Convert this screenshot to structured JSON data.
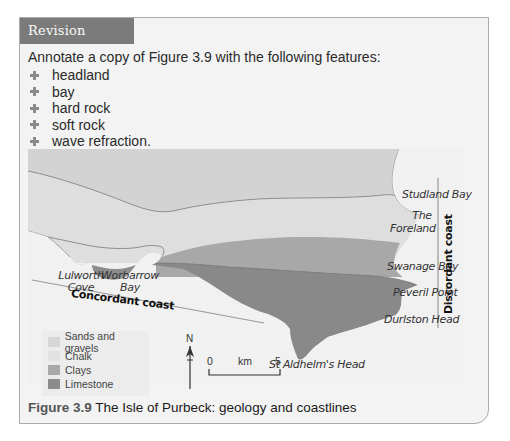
{
  "activity": {
    "header": "Revision activity",
    "intro": "Annotate a copy of Figure 3.9 with the following features:",
    "items": [
      "headland",
      "bay",
      "hard rock",
      "soft rock",
      "wave refraction."
    ]
  },
  "map": {
    "labels": {
      "studland_bay": "Studland Bay",
      "the_foreland_1": "The",
      "the_foreland_2": "Foreland",
      "swanage_bay": "Swanage Bay",
      "peveril_point": "Peveril Point",
      "durlston_head": "Durlston Head",
      "st_aldhelms_head": "St Aldhelm's Head",
      "lulworth_1": "Lulworth",
      "lulworth_2": "Cove",
      "worbarrow_1": "Worbarrow",
      "worbarrow_2": "Bay",
      "concordant_coast": "Concordant coast",
      "discordant_coast": "Discordant coast"
    },
    "legend": [
      {
        "label": "Sands and gravels",
        "color": "#d6d6d6"
      },
      {
        "label": "Chalk",
        "color": "#e0e0e0"
      },
      {
        "label": "Clays",
        "color": "#a9a9a9"
      },
      {
        "label": "Limestone",
        "color": "#8c8c8c"
      }
    ],
    "north_label": "N",
    "scale": {
      "start": "0",
      "unit": "km",
      "end": "5"
    },
    "colors": {
      "sea": "#f3f3f3",
      "sands": "#d2d2d2",
      "chalk": "#dedede",
      "clays": "#a8a8a8",
      "limestone": "#8a8a8a",
      "boundary": "#8e8e8e"
    }
  },
  "caption": {
    "number": "Figure 3.9",
    "text": " The Isle of Purbeck: geology and coastlines"
  },
  "colors": {
    "header_bg": "#7b7b7b",
    "card_bg": "#f3f3f3",
    "bullet": "#8a8a8a"
  }
}
